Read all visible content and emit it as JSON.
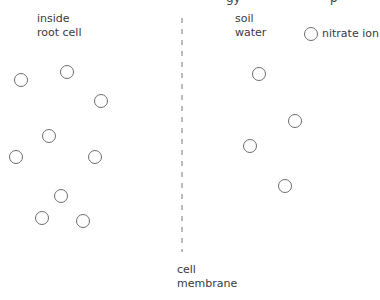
{
  "top_cut_text": {
    "left": "gy",
    "right": "p"
  },
  "labels": {
    "inside": "inside\nroot cell",
    "outside": "soil\nwater",
    "membrane": "cell\nmembrane",
    "legend": "nitrate ion"
  },
  "legend": {
    "symbol": "circle",
    "meaning": "nitrate ion"
  },
  "ions": {
    "inside_root_cell": [
      [
        21,
        80
      ],
      [
        67,
        72
      ],
      [
        101,
        101
      ],
      [
        49,
        136
      ],
      [
        16,
        157
      ],
      [
        95,
        157
      ],
      [
        61,
        196
      ],
      [
        42,
        218
      ],
      [
        83,
        221
      ]
    ],
    "soil_water": [
      [
        259,
        74
      ],
      [
        295,
        121
      ],
      [
        250,
        146
      ],
      [
        285,
        186
      ]
    ],
    "count_inside": 9,
    "count_outside": 4
  },
  "colors": {
    "stroke": "#6e6e6e",
    "text": "#3a3a3a"
  }
}
